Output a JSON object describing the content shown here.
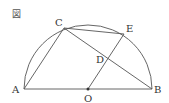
{
  "figure_label": "図",
  "points": {
    "A": "A",
    "B": "B",
    "C": "C",
    "D": "D",
    "E": "E",
    "O": "O"
  },
  "colors": {
    "stroke": "#555555",
    "text": "#333333"
  }
}
